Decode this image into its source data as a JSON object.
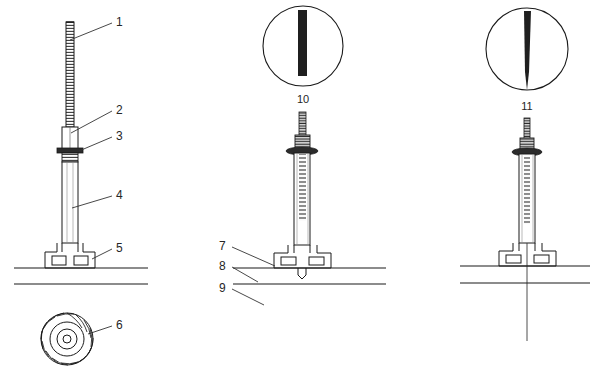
{
  "figure": {
    "background_color": "#ffffff",
    "line_color": "#1a1a1a",
    "fill_color": "#2b2b2b",
    "views": [
      {
        "name": "left-elevation",
        "label": "Extended mast on pedestal base"
      },
      {
        "name": "center-elevation",
        "label": "Mast with ground line detail"
      },
      {
        "name": "right-elevation",
        "label": "Mast with centerline below grade"
      }
    ]
  },
  "callouts": [
    {
      "id": "1",
      "text": "1",
      "x": 116,
      "y": 26,
      "anchor": "start",
      "target": "upper-mast-tip"
    },
    {
      "id": "2",
      "text": "2",
      "x": 116,
      "y": 114,
      "anchor": "start",
      "target": "middle-mast-section"
    },
    {
      "id": "3",
      "text": "3",
      "x": 116,
      "y": 140,
      "anchor": "start",
      "target": "collar-flange"
    },
    {
      "id": "4",
      "text": "4",
      "x": 116,
      "y": 199,
      "anchor": "start",
      "target": "lower-mast-tube"
    },
    {
      "id": "5",
      "text": "5",
      "x": 116,
      "y": 252,
      "anchor": "start",
      "target": "pedestal-base"
    },
    {
      "id": "6",
      "text": "6",
      "x": 116,
      "y": 329,
      "anchor": "start",
      "target": "impeller-wheel"
    },
    {
      "id": "7",
      "text": "7",
      "x": 219,
      "y": 250,
      "anchor": "start",
      "target": "base-plate"
    },
    {
      "id": "8",
      "text": "8",
      "x": 219,
      "y": 270,
      "anchor": "start",
      "target": "grade-line-upper"
    },
    {
      "id": "9",
      "text": "9",
      "x": 219,
      "y": 292,
      "anchor": "start",
      "target": "grade-line-lower"
    },
    {
      "id": "10",
      "text": "10",
      "x": 303,
      "y": 103,
      "anchor": "middle",
      "target": "detail-circle-straight"
    },
    {
      "id": "11",
      "text": "11",
      "x": 527,
      "y": 110,
      "anchor": "middle",
      "target": "detail-circle-tapered"
    }
  ],
  "detail_views": [
    {
      "id": "detail-10",
      "caption": "10",
      "center_x": 303,
      "center_y": 46,
      "radius": 40,
      "profile": "straight-bar",
      "bar_width": 9,
      "bar_top": 12,
      "bar_bottom": 78
    },
    {
      "id": "detail-11",
      "caption": "11",
      "center_x": 527,
      "center_y": 49,
      "radius": 41,
      "profile": "tapered-point",
      "bar_width": 7,
      "bar_top": 12,
      "bar_bottom": 87
    }
  ],
  "impeller": {
    "id": "impeller-wheel",
    "center_x": 67,
    "center_y": 339,
    "outer_radius": 26,
    "inner_radius": 17,
    "hub_radius": 10,
    "bore_radius": 4,
    "blade_count": 18
  },
  "ground_lines": [
    {
      "id": "grade-line-upper-left",
      "x1": 14,
      "x2": 148,
      "y": 268
    },
    {
      "id": "grade-line-lower-left",
      "x1": 14,
      "x2": 148,
      "y": 284
    },
    {
      "id": "grade-line-upper-mid",
      "x1": 233,
      "x2": 386,
      "y": 268
    },
    {
      "id": "grade-line-lower-mid",
      "x1": 233,
      "x2": 386,
      "y": 284
    },
    {
      "id": "grade-line-upper-right",
      "x1": 460,
      "x2": 590,
      "y": 266
    },
    {
      "id": "grade-line-lower-right",
      "x1": 460,
      "x2": 590,
      "y": 283
    }
  ]
}
